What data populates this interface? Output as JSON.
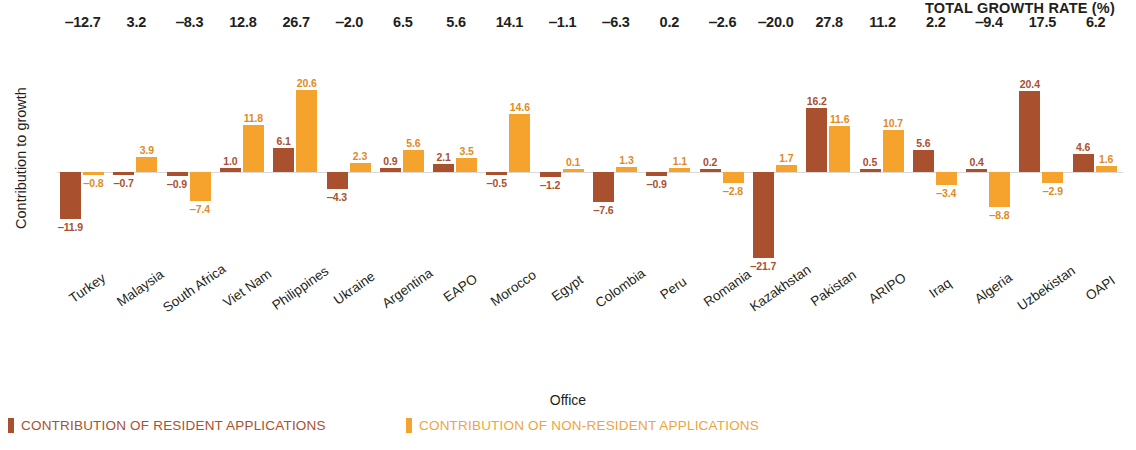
{
  "chart_data": {
    "type": "bar",
    "title": "",
    "xlabel": "Office",
    "ylabel": "Contribution to growth",
    "totals_header": "TOTAL GROWTH RATE (%)",
    "grid": false,
    "legend_position": "bottom-left",
    "ylim": [
      -24,
      24
    ],
    "categories": [
      "Turkey",
      "Malaysia",
      "South Africa",
      "Viet Nam",
      "Philippines",
      "Ukraine",
      "Argentina",
      "EAPO",
      "Morocco",
      "Egypt",
      "Colombia",
      "Peru",
      "Romania",
      "Kazakhstan",
      "Pakistan",
      "ARIPO",
      "Iraq",
      "Algeria",
      "Uzbekistan",
      "OAPI"
    ],
    "series": [
      {
        "name": "CONTRIBUTION OF RESIDENT APPLICATIONS",
        "color": "#a9502f",
        "values": [
          -11.9,
          -0.7,
          -0.9,
          1.0,
          6.1,
          -4.3,
          0.9,
          2.1,
          -0.5,
          -1.2,
          -7.6,
          -0.9,
          0.2,
          -21.7,
          16.2,
          0.5,
          5.6,
          0.4,
          20.4,
          4.6
        ]
      },
      {
        "name": "CONTRIBUTION OF NON-RESIDENT APPLICATIONS",
        "color": "#f5a32d",
        "values": [
          -0.8,
          3.9,
          -7.4,
          11.8,
          20.6,
          2.3,
          5.6,
          3.5,
          14.6,
          0.1,
          1.3,
          1.1,
          -2.8,
          1.7,
          11.6,
          10.7,
          -3.4,
          -8.8,
          -2.9,
          1.6
        ]
      }
    ],
    "totals": [
      "‒12.7",
      "3.2",
      "‒8.3",
      "12.8",
      "26.7",
      "‒2.0",
      "6.5",
      "5.6",
      "14.1",
      "‒1.1",
      "‒6.3",
      "0.2",
      "‒2.6",
      "‒20.0",
      "27.8",
      "11.2",
      "2.2",
      "‒9.4",
      "17.5",
      "6.2"
    ],
    "labels_resident": [
      "‒11.9",
      "‒0.7",
      "‒0.9",
      "1.0",
      "6.1",
      "‒4.3",
      "0.9",
      "2.1",
      "‒0.5",
      "‒1.2",
      "‒7.6",
      "‒0.9",
      "0.2",
      "‒21.7",
      "16.2",
      "0.5",
      "5.6",
      "0.4",
      "20.4",
      "4.6"
    ],
    "labels_nonresident": [
      "‒0.8",
      "3.9",
      "‒7.4",
      "11.8",
      "20.6",
      "2.3",
      "5.6",
      "3.5",
      "14.6",
      "0.1",
      "1.3",
      "1.1",
      "‒2.8",
      "1.7",
      "11.6",
      "10.7",
      "‒3.4",
      "‒8.8",
      "‒2.9",
      "1.6"
    ]
  },
  "legend": [
    {
      "label": "CONTRIBUTION OF RESIDENT APPLICATIONS",
      "color": "#a9502f"
    },
    {
      "label": "CONTRIBUTION OF NON-RESIDENT APPLICATIONS",
      "color": "#f5a32d"
    }
  ]
}
